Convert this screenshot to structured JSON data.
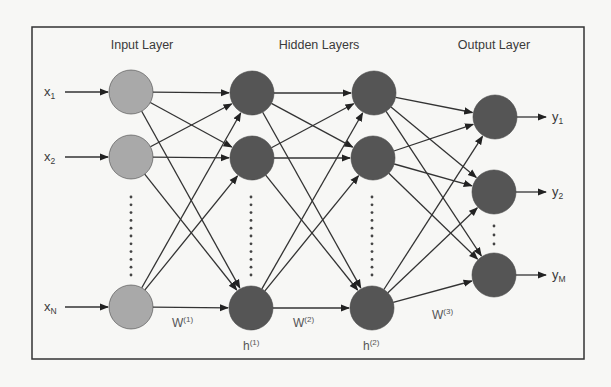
{
  "diagram": {
    "frame": {
      "x": 32,
      "y": 27,
      "width": 552,
      "height": 332,
      "stroke": "#333333"
    },
    "colors": {
      "background": "#f7f7f5",
      "input_node": "#a9a9a9",
      "hidden_node": "#555555",
      "output_node": "#555555",
      "edge": "#333333",
      "text": "#3a3a3a"
    },
    "node_radius": 22,
    "layer_titles": [
      {
        "id": "input",
        "label": "Input Layer",
        "x": 142,
        "y": 49
      },
      {
        "id": "hidden",
        "label": "Hidden Layers",
        "x": 319,
        "y": 49
      },
      {
        "id": "output",
        "label": "Output Layer",
        "x": 494,
        "y": 49
      }
    ],
    "layers": [
      {
        "id": "input",
        "type": "input",
        "nodes": [
          {
            "id": "x1",
            "cx": 131,
            "cy": 92
          },
          {
            "id": "x2",
            "cx": 131,
            "cy": 157
          },
          {
            "id": "xN",
            "cx": 131,
            "cy": 307
          }
        ],
        "ellipsis": {
          "x": 131,
          "y_start": 197,
          "y_end": 275,
          "count": 11
        }
      },
      {
        "id": "h1",
        "type": "hidden",
        "nodes": [
          {
            "id": "h1_1",
            "cx": 252,
            "cy": 93
          },
          {
            "id": "h1_2",
            "cx": 252,
            "cy": 158
          },
          {
            "id": "h1_N",
            "cx": 251,
            "cy": 308
          }
        ],
        "ellipsis": {
          "x": 251,
          "y_start": 197,
          "y_end": 275,
          "count": 11
        },
        "label": {
          "base": "h",
          "sup": "(1)",
          "x": 243,
          "y": 350
        }
      },
      {
        "id": "h2",
        "type": "hidden",
        "nodes": [
          {
            "id": "h2_1",
            "cx": 374,
            "cy": 93
          },
          {
            "id": "h2_2",
            "cx": 373,
            "cy": 158
          },
          {
            "id": "h2_N",
            "cx": 372,
            "cy": 308
          }
        ],
        "ellipsis": {
          "x": 372,
          "y_start": 197,
          "y_end": 275,
          "count": 11
        },
        "label": {
          "base": "h",
          "sup": "(2)",
          "x": 363,
          "y": 350
        }
      },
      {
        "id": "output",
        "type": "output",
        "nodes": [
          {
            "id": "y1",
            "cx": 495,
            "cy": 117
          },
          {
            "id": "y2",
            "cx": 494,
            "cy": 192
          },
          {
            "id": "yM",
            "cx": 494,
            "cy": 275
          }
        ],
        "ellipsis": {
          "x": 494,
          "y_start": 226,
          "y_end": 244,
          "count": 3
        }
      }
    ],
    "weights": [
      {
        "base": "W",
        "sup": "(1)",
        "x": 172,
        "y": 327
      },
      {
        "base": "W",
        "sup": "(2)",
        "x": 293,
        "y": 327
      },
      {
        "base": "W",
        "sup": "(3)",
        "x": 432,
        "y": 319
      }
    ],
    "inputs": [
      {
        "base": "x",
        "sub": "1",
        "x": 44,
        "y": 96,
        "arrow_from": 65,
        "node": "x1"
      },
      {
        "base": "x",
        "sub": "2",
        "x": 44,
        "y": 161,
        "arrow_from": 65,
        "node": "x2"
      },
      {
        "base": "x",
        "sub": "N",
        "x": 44,
        "y": 311,
        "arrow_from": 65,
        "node": "xN"
      }
    ],
    "outputs": [
      {
        "base": "y",
        "sub": "1",
        "x": 552,
        "y": 121,
        "arrow_to": 546,
        "node": "y1"
      },
      {
        "base": "y",
        "sub": "2",
        "x": 552,
        "y": 196,
        "arrow_to": 546,
        "node": "y2"
      },
      {
        "base": "y",
        "sub": "M",
        "x": 552,
        "y": 279,
        "arrow_to": 546,
        "node": "yM"
      }
    ]
  }
}
